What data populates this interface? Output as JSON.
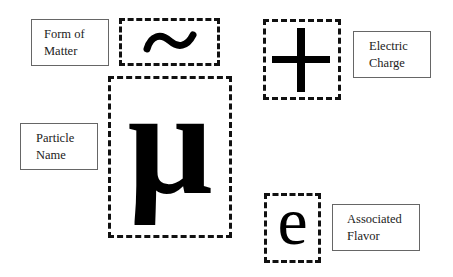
{
  "diagram": {
    "title": "",
    "labels": {
      "form_of_matter": {
        "line1": "Form of",
        "line2": "Matter"
      },
      "electric_charge": {
        "line1": "Electric",
        "line2": "Charge"
      },
      "particle_name": {
        "line1": "Particle",
        "line2": "Name"
      },
      "associated_flavor": {
        "line1": "Associated",
        "line2": "Flavor"
      }
    },
    "symbols": {
      "form_of_matter": "~",
      "electric_charge": "+",
      "particle_name": "μ",
      "associated_flavor": "e"
    },
    "colors": {
      "border_dashed": "#111111",
      "border_label": "#666666",
      "text": "#222222",
      "background": "#ffffff"
    }
  }
}
